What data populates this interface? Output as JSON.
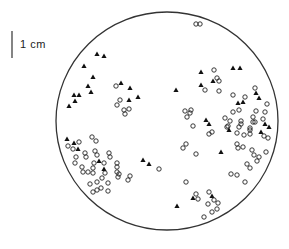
{
  "scale_bar": {
    "label": "1 cm",
    "x": 12,
    "y1": 31,
    "y2": 58
  },
  "dish": {
    "cx": 167,
    "cy": 121,
    "rx": 111,
    "ry": 109,
    "stroke": "#333333"
  },
  "legend_markers": {
    "filled_triangle": "triangle",
    "open_circle": "circle"
  },
  "triangles": [
    [
      97,
      54
    ],
    [
      104,
      56
    ],
    [
      84,
      66
    ],
    [
      93,
      77
    ],
    [
      88,
      86
    ],
    [
      91,
      92
    ],
    [
      74,
      95
    ],
    [
      79,
      95
    ],
    [
      75,
      101
    ],
    [
      69,
      106
    ],
    [
      121,
      83
    ],
    [
      130,
      88
    ],
    [
      138,
      97
    ],
    [
      129,
      100
    ],
    [
      176,
      90
    ],
    [
      201,
      72
    ],
    [
      233,
      68
    ],
    [
      240,
      68
    ],
    [
      213,
      81
    ],
    [
      201,
      85
    ],
    [
      256,
      93
    ],
    [
      259,
      98
    ],
    [
      238,
      103
    ],
    [
      243,
      102
    ],
    [
      206,
      120
    ],
    [
      209,
      124
    ],
    [
      229,
      130
    ],
    [
      265,
      124
    ],
    [
      269,
      127
    ],
    [
      261,
      132
    ],
    [
      221,
      152
    ],
    [
      67,
      139
    ],
    [
      74,
      143
    ],
    [
      78,
      149
    ],
    [
      99,
      161
    ],
    [
      104,
      169
    ],
    [
      143,
      160
    ],
    [
      149,
      164
    ],
    [
      193,
      198
    ],
    [
      212,
      196
    ],
    [
      177,
      206
    ]
  ],
  "circles": [
    [
      196,
      24
    ],
    [
      200,
      24
    ],
    [
      116,
      86
    ],
    [
      120,
      100
    ],
    [
      117,
      105
    ],
    [
      124,
      110
    ],
    [
      129,
      109
    ],
    [
      125,
      114
    ],
    [
      214,
      70
    ],
    [
      217,
      78
    ],
    [
      219,
      81
    ],
    [
      205,
      90
    ],
    [
      219,
      91
    ],
    [
      233,
      95
    ],
    [
      255,
      88
    ],
    [
      245,
      97
    ],
    [
      267,
      104
    ],
    [
      239,
      110
    ],
    [
      233,
      112
    ],
    [
      256,
      111
    ],
    [
      265,
      112
    ],
    [
      185,
      111
    ],
    [
      191,
      110
    ],
    [
      187,
      117
    ],
    [
      190,
      113
    ],
    [
      225,
      118
    ],
    [
      230,
      121
    ],
    [
      253,
      117
    ],
    [
      241,
      121
    ],
    [
      255,
      122
    ],
    [
      193,
      126
    ],
    [
      227,
      127
    ],
    [
      239,
      127
    ],
    [
      250,
      128
    ],
    [
      263,
      119
    ],
    [
      241,
      124
    ],
    [
      253,
      122
    ],
    [
      228,
      126
    ],
    [
      237,
      133
    ],
    [
      244,
      135
    ],
    [
      250,
      130
    ],
    [
      250,
      134
    ],
    [
      212,
      132
    ],
    [
      209,
      134
    ],
    [
      264,
      136
    ],
    [
      268,
      138
    ],
    [
      186,
      144
    ],
    [
      183,
      148
    ],
    [
      237,
      144
    ],
    [
      238,
      148
    ],
    [
      243,
      147
    ],
    [
      252,
      150
    ],
    [
      254,
      155
    ],
    [
      259,
      157
    ],
    [
      257,
      161
    ],
    [
      266,
      152
    ],
    [
      196,
      154
    ],
    [
      247,
      164
    ],
    [
      250,
      168
    ],
    [
      231,
      174
    ],
    [
      237,
      175
    ],
    [
      245,
      182
    ],
    [
      186,
      182
    ],
    [
      68,
      146
    ],
    [
      79,
      142
    ],
    [
      73,
      149
    ],
    [
      92,
      137
    ],
    [
      96,
      141
    ],
    [
      76,
      157
    ],
    [
      85,
      153
    ],
    [
      86,
      157
    ],
    [
      95,
      151
    ],
    [
      97,
      155
    ],
    [
      109,
      153
    ],
    [
      110,
      157
    ],
    [
      75,
      163
    ],
    [
      94,
      163
    ],
    [
      104,
      163
    ],
    [
      117,
      163
    ],
    [
      117,
      167
    ],
    [
      82,
      167
    ],
    [
      93,
      168
    ],
    [
      83,
      172
    ],
    [
      88,
      172
    ],
    [
      93,
      173
    ],
    [
      105,
      173
    ],
    [
      117,
      172
    ],
    [
      119,
      174
    ],
    [
      118,
      177
    ],
    [
      130,
      176
    ],
    [
      128,
      180
    ],
    [
      102,
      178
    ],
    [
      97,
      182
    ],
    [
      90,
      184
    ],
    [
      108,
      183
    ],
    [
      101,
      188
    ],
    [
      97,
      190
    ],
    [
      93,
      192
    ],
    [
      108,
      191
    ],
    [
      159,
      169
    ],
    [
      196,
      194
    ],
    [
      198,
      199
    ],
    [
      209,
      192
    ],
    [
      214,
      200
    ],
    [
      218,
      203
    ],
    [
      208,
      204
    ],
    [
      217,
      209
    ],
    [
      212,
      212
    ],
    [
      204,
      217
    ]
  ]
}
